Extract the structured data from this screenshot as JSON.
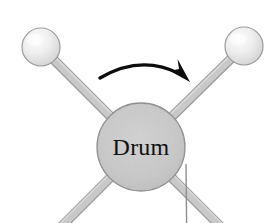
{
  "figure": {
    "width": 279,
    "height": 223,
    "background_color": "#ffffff"
  },
  "drum": {
    "label": "Drum",
    "center_x": 141,
    "center_y": 147,
    "radius": 44,
    "fill_color": "#c9c9c9",
    "edge_color": "#8d8d8d",
    "label_color": "#111111"
  },
  "spokes": [
    {
      "name": "spoke-upper-left",
      "angle_deg": 225,
      "end_x": 41,
      "end_y": 47,
      "width": 8,
      "fill_color": "#c5c5c5",
      "edge_color": "#9a9a9a"
    },
    {
      "name": "spoke-upper-right",
      "angle_deg": 315,
      "end_x": 244,
      "end_y": 46,
      "width": 8,
      "fill_color": "#c5c5c5",
      "edge_color": "#9a9a9a"
    },
    {
      "name": "spoke-lower-left",
      "angle_deg": 135,
      "end_x": 36,
      "end_y": 252,
      "width": 8,
      "fill_color": "#c5c5c5",
      "edge_color": "#9a9a9a"
    },
    {
      "name": "spoke-lower-right",
      "angle_deg": 45,
      "end_x": 247,
      "end_y": 253,
      "width": 8,
      "fill_color": "#c5c5c5",
      "edge_color": "#9a9a9a"
    }
  ],
  "balls": [
    {
      "name": "ball-upper-left",
      "center_x": 41,
      "center_y": 47,
      "radius": 19,
      "fill_color": "#e8e8e8",
      "highlight_color": "#fbfbfb",
      "edge_color": "#9b9b9b"
    },
    {
      "name": "ball-upper-right",
      "center_x": 244,
      "center_y": 46,
      "radius": 19,
      "fill_color": "#e8e8e8",
      "highlight_color": "#fbfbfb",
      "edge_color": "#9b9b9b"
    }
  ],
  "rotation_arrow": {
    "name": "rotation-arrow",
    "direction": "clockwise",
    "color": "#0d0d0d",
    "start_x": 100,
    "start_y": 78,
    "end_x": 183,
    "end_y": 73,
    "apex_x": 141,
    "apex_y": 59
  },
  "reference_line": {
    "name": "vertical-reference-line",
    "x": 186,
    "y_start": 164,
    "y_end": 223,
    "color": "#8f8f8f",
    "width": 1.4
  }
}
